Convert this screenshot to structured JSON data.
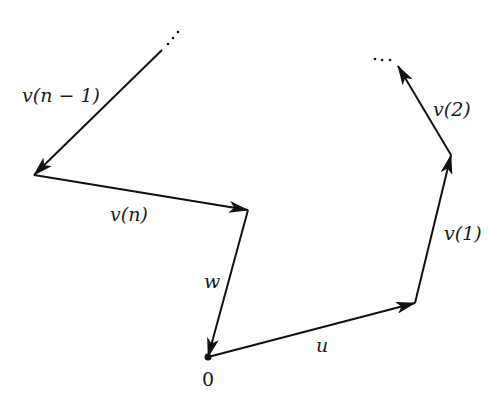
{
  "diagram": {
    "type": "vector-path-diagram",
    "stroke_color": "#111111",
    "background": "#ffffff",
    "points": {
      "origin": [
        208,
        357
      ],
      "p1": [
        415,
        303
      ],
      "p2": [
        451,
        155
      ],
      "p3": [
        398,
        66
      ],
      "q_start": [
        162,
        50
      ],
      "q1": [
        34,
        175
      ],
      "q2": [
        248,
        210
      ]
    },
    "origin_label": "0",
    "vectors": [
      {
        "id": "u",
        "label": "u",
        "from": "origin",
        "to": "p1"
      },
      {
        "id": "v1",
        "label": "v(1)",
        "from": "p1",
        "to": "p2"
      },
      {
        "id": "v2",
        "label": "v(2)",
        "from": "p2",
        "to": "p3"
      },
      {
        "id": "vn-1",
        "label": "v(n − 1)",
        "from": "q_start",
        "to": "q1"
      },
      {
        "id": "vn",
        "label": "v(n)",
        "from": "q1",
        "to": "q2"
      },
      {
        "id": "w",
        "label": "w",
        "from": "q2",
        "to": "origin"
      }
    ],
    "ellipsis_top_right": "···",
    "ellipsis_top_left": "···"
  }
}
